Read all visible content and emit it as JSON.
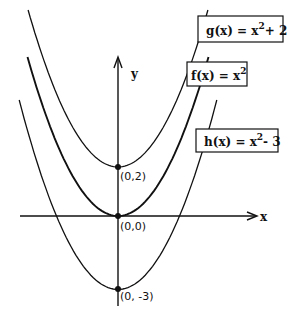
{
  "chart_data": {
    "type": "line",
    "title": "",
    "xlabel": "x",
    "ylabel": "y",
    "grid": false,
    "legend": "boxed labels at right, attached to each curve",
    "series": [
      {
        "name": "g(x) = x^2 + 2",
        "label": "g(x) = x",
        "sup": "2",
        "tail": "+ 2",
        "shift": 2,
        "vertex": "(0,2)"
      },
      {
        "name": "f(x) = x^2",
        "label": "f(x) = x",
        "sup": "2",
        "tail": "",
        "shift": 0,
        "vertex": "(0,0)"
      },
      {
        "name": "h(x) = x^2 - 3",
        "label": "h(x) = x",
        "sup": "2",
        "tail": "- 3",
        "shift": -3,
        "vertex": "(0, -3)"
      }
    ],
    "points": [
      {
        "x": 0,
        "y": 2,
        "label": "(0,2)"
      },
      {
        "x": 0,
        "y": 0,
        "label": "(0,0)"
      },
      {
        "x": 0,
        "y": -3,
        "label": "(0, -3)"
      }
    ],
    "xlim": [
      -3.1,
      3.1
    ],
    "ylim": [
      -3.7,
      6.5
    ]
  }
}
